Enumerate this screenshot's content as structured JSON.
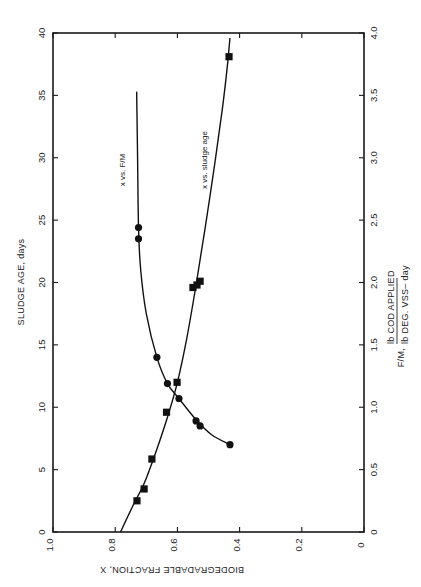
{
  "chart_data": {
    "type": "scatter",
    "orientation": "figure rotated 90 degrees counter-clockwise on page",
    "title": "",
    "xlabel": "BIODEGRADABLE FRACTION, X",
    "x_ticks": [
      "1.0",
      "0.8",
      "0.6",
      "0.4",
      "0.2",
      "0"
    ],
    "xlim": [
      1.0,
      0
    ],
    "ylabel_left": "SLUDGE AGE, days",
    "y_left_ticks": [
      "0",
      "5",
      "10",
      "15",
      "20",
      "25",
      "30",
      "35",
      "40"
    ],
    "ylim_left": [
      0,
      40
    ],
    "ylabel_right": {
      "prefix": "F/M,",
      "numerator": "lb   COD APPLIED",
      "denominator": "lb   DEG. VSS– day"
    },
    "y_right_ticks": [
      "0",
      "0.5",
      "1.0",
      "1.5",
      "2.0",
      "2.5",
      "3.0",
      "3.5",
      "4.0"
    ],
    "ylim_right": [
      0,
      4.0
    ],
    "grid": false,
    "series": [
      {
        "name": "x vs. F/M",
        "marker": "circle",
        "axis": "right",
        "points": [
          {
            "x": 0.725,
            "y": 2.44
          },
          {
            "x": 0.725,
            "y": 2.35
          },
          {
            "x": 0.666,
            "y": 1.4
          },
          {
            "x": 0.632,
            "y": 1.19
          },
          {
            "x": 0.595,
            "y": 1.07
          },
          {
            "x": 0.54,
            "y": 0.89
          },
          {
            "x": 0.527,
            "y": 0.85
          },
          {
            "x": 0.431,
            "y": 0.7
          }
        ],
        "fit_curve": [
          {
            "x": 0.731,
            "y": 3.53
          },
          {
            "x": 0.728,
            "y": 3.0
          },
          {
            "x": 0.725,
            "y": 2.44
          },
          {
            "x": 0.718,
            "y": 2.1
          },
          {
            "x": 0.7,
            "y": 1.75
          },
          {
            "x": 0.666,
            "y": 1.4
          },
          {
            "x": 0.632,
            "y": 1.19
          },
          {
            "x": 0.595,
            "y": 1.07
          },
          {
            "x": 0.54,
            "y": 0.9
          },
          {
            "x": 0.49,
            "y": 0.78
          },
          {
            "x": 0.431,
            "y": 0.7
          }
        ]
      },
      {
        "name": "x vs. sludge age",
        "marker": "square",
        "axis": "left",
        "points": [
          {
            "x": 0.73,
            "y": 2.5
          },
          {
            "x": 0.707,
            "y": 3.45
          },
          {
            "x": 0.682,
            "y": 5.85
          },
          {
            "x": 0.635,
            "y": 9.6
          },
          {
            "x": 0.601,
            "y": 12.0
          },
          {
            "x": 0.55,
            "y": 19.6
          },
          {
            "x": 0.537,
            "y": 19.8
          },
          {
            "x": 0.527,
            "y": 20.1
          },
          {
            "x": 0.434,
            "y": 38.1
          }
        ],
        "fit_curve": [
          {
            "x": 0.783,
            "y": 0
          },
          {
            "x": 0.745,
            "y": 2.0
          },
          {
            "x": 0.705,
            "y": 4.0
          },
          {
            "x": 0.668,
            "y": 6.5
          },
          {
            "x": 0.632,
            "y": 9.2
          },
          {
            "x": 0.6,
            "y": 12.0
          },
          {
            "x": 0.57,
            "y": 15.5
          },
          {
            "x": 0.54,
            "y": 19.8
          },
          {
            "x": 0.51,
            "y": 24.5
          },
          {
            "x": 0.48,
            "y": 29.5
          },
          {
            "x": 0.455,
            "y": 34.0
          },
          {
            "x": 0.44,
            "y": 37.2
          },
          {
            "x": 0.431,
            "y": 39.6
          }
        ]
      }
    ],
    "annotations": [
      {
        "text": "x vs. F/M",
        "near_series": "x vs. F/M"
      },
      {
        "text": "x vs. sludge age",
        "near_series": "x vs. sludge age"
      }
    ],
    "legend": "none (inline labels)"
  },
  "labels": {
    "left_axis": "SLUDGE AGE, days",
    "bottom_axis": "BIODEGRADABLE FRACTION, X",
    "right_prefix": "F/M,",
    "right_num": "lb   COD APPLIED",
    "right_den": "lb   DEG. VSS– day",
    "series_fm": "x vs. F/M",
    "series_age": "x vs. sludge age"
  }
}
